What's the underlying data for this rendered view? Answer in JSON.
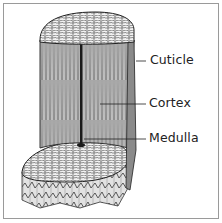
{
  "diagram": {
    "labels": [
      {
        "id": "cuticle",
        "text": "Cuticle"
      },
      {
        "id": "cortex",
        "text": "Cortex"
      },
      {
        "id": "medulla",
        "text": "Medulla"
      }
    ],
    "colors": {
      "frame": "#9a9a9a",
      "ink": "#222222",
      "fiber": "#555555",
      "background": "#ffffff"
    }
  }
}
